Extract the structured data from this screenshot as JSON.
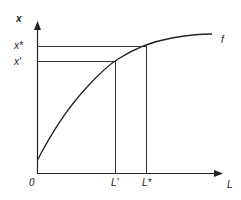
{
  "diagram": {
    "y_axis_label": "x",
    "x_axis_label": "L",
    "origin_label": "0",
    "curve_label": "f",
    "y_ticks": [
      {
        "label": "x*",
        "y": 46
      },
      {
        "label": "x'",
        "y": 61
      }
    ],
    "x_ticks": [
      {
        "label": "L'",
        "x": 115
      },
      {
        "label": "L*",
        "x": 146
      }
    ],
    "colors": {
      "line": "#222222",
      "background": "#ffffff"
    }
  }
}
